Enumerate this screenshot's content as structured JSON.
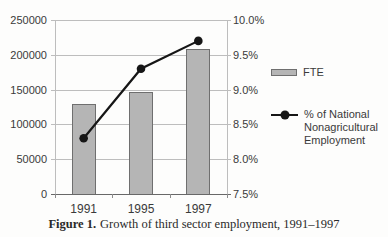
{
  "chart_data": {
    "type": "bar+line combo",
    "categories": [
      "1991",
      "1995",
      "1997"
    ],
    "series": [
      {
        "name": "FTE",
        "type": "bar",
        "axis": "left",
        "values": [
          130000,
          147000,
          208000
        ],
        "color": "#b5b5b5",
        "border_color": "#6f6f6f"
      },
      {
        "name": "% of National Nonagricultural Employment",
        "type": "line",
        "axis": "right",
        "values": [
          8.3,
          9.3,
          9.7
        ],
        "color": "#161616",
        "marker": "filled-circle"
      }
    ],
    "left_axis": {
      "ticks": [
        "250000",
        "200000",
        "150000",
        "100000",
        "50000",
        "0"
      ],
      "min": 0,
      "max": 250000
    },
    "right_axis": {
      "ticks": [
        "10.0%",
        "9.5%",
        "9.0%",
        "8.5%",
        "8.0%",
        "7.5%"
      ],
      "min": 7.5,
      "max": 10.0
    },
    "grid": true,
    "legend_position": "right"
  },
  "legend": {
    "fte_label": "FTE",
    "line_label_lines": [
      "% of National",
      "Nonagricultural",
      "Employment"
    ]
  },
  "caption": {
    "prefix": "Figure 1.",
    "text": "Growth of third sector employment, 1991–1997"
  }
}
